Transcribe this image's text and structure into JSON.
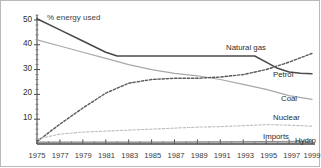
{
  "chart_data": {
    "type": "line",
    "title": "% energy used",
    "xlabel": "",
    "ylabel": "% energy used",
    "xlim": [
      1975,
      1999
    ],
    "ylim": [
      0,
      52
    ],
    "yticks": [
      10,
      20,
      30,
      40,
      50
    ],
    "xticks": [
      1975,
      1977,
      1979,
      1981,
      1983,
      1985,
      1987,
      1989,
      1991,
      1993,
      1995,
      1997,
      1999
    ],
    "x_minor_step": 1,
    "grid": false,
    "legend_position": "right-inline",
    "series": [
      {
        "name": "Petrol",
        "label": "Petrol",
        "color": "#4a4a4a",
        "style": "solid",
        "width": 1.6,
        "x": [
          1975,
          1977,
          1979,
          1981,
          1982,
          1984,
          1986,
          1988,
          1990,
          1992,
          1994,
          1995,
          1996,
          1997,
          1998,
          1999
        ],
        "values": [
          50.5,
          46.0,
          41.5,
          37.0,
          35.5,
          35.5,
          35.5,
          35.5,
          35.5,
          35.5,
          35.5,
          33.0,
          30.5,
          29.0,
          28.5,
          28.3
        ]
      },
      {
        "name": "Coal",
        "label": "Coal",
        "color": "#a8a8a8",
        "style": "solid",
        "width": 1.2,
        "x": [
          1975,
          1977,
          1979,
          1981,
          1983,
          1985,
          1987,
          1989,
          1991,
          1993,
          1995,
          1997,
          1999
        ],
        "values": [
          42.0,
          39.5,
          37.0,
          34.5,
          32.0,
          30.0,
          28.5,
          27.5,
          26.0,
          24.0,
          22.0,
          19.5,
          18.0
        ]
      },
      {
        "name": "Natural gas",
        "label": "Natural gas",
        "color": "#5a5a5a",
        "style": "dashed",
        "width": 1.4,
        "x": [
          1975,
          1976,
          1977,
          1979,
          1981,
          1983,
          1985,
          1987,
          1989,
          1991,
          1993,
          1995,
          1997,
          1999
        ],
        "values": [
          1.0,
          4.5,
          8.0,
          14.5,
          20.5,
          24.5,
          26.0,
          26.5,
          26.5,
          27.0,
          28.0,
          30.0,
          33.0,
          36.5
        ]
      },
      {
        "name": "Nuclear",
        "label": "Nuclear",
        "color": "#bdbdbd",
        "style": "dashed",
        "width": 1.1,
        "x": [
          1975,
          1977,
          1979,
          1981,
          1983,
          1985,
          1987,
          1989,
          1991,
          1993,
          1995,
          1997,
          1999
        ],
        "values": [
          2.0,
          4.0,
          4.8,
          5.2,
          5.6,
          6.0,
          6.4,
          6.8,
          7.0,
          7.4,
          7.8,
          7.6,
          7.2
        ]
      },
      {
        "name": "Imports",
        "label": "Imports",
        "color": "#8a8a8a",
        "style": "solid",
        "width": 1.1,
        "x": [
          1975,
          1980,
          1985,
          1990,
          1995,
          1999
        ],
        "values": [
          0.8,
          0.8,
          0.8,
          0.9,
          1.0,
          1.1
        ]
      },
      {
        "name": "Hydro",
        "label": "Hydro",
        "color": "#6e6e6e",
        "style": "solid",
        "width": 1.1,
        "x": [
          1975,
          1980,
          1985,
          1990,
          1995,
          1999
        ],
        "values": [
          0.4,
          0.4,
          0.4,
          0.4,
          0.4,
          0.4
        ]
      }
    ]
  },
  "labels": {
    "natural_gas": "Natural gas",
    "petrol": "Petrol",
    "coal": "Coal",
    "nuclear": "Nuclear",
    "imports": "Imports",
    "hydro": "Hydro"
  },
  "yticks": {
    "t10": "10",
    "t20": "20",
    "t30": "30",
    "t40": "40",
    "t50": "50"
  },
  "xticks": {
    "x1975": "1975",
    "x1977": "1977",
    "x1979": "1979",
    "x1981": "1981",
    "x1983": "1983",
    "x1985": "1985",
    "x1987": "1987",
    "x1989": "1989",
    "x1991": "1991",
    "x1993": "1993",
    "x1995": "1995",
    "x1997": "1997",
    "x1999": "1999"
  }
}
